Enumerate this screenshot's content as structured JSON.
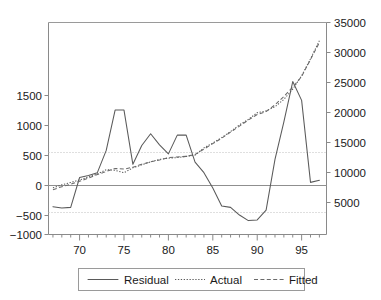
{
  "chart_data": {
    "type": "line",
    "title": "",
    "subtitle": "",
    "xlabel": "",
    "ylabel": "",
    "grid": "horizontal-dotted",
    "legend_position": "bottom",
    "xlim": [
      66.5,
      97.8
    ],
    "x_major_ticks": [
      70,
      75,
      80,
      85,
      90,
      95
    ],
    "x_major_tick_labels": [
      "70",
      "75",
      "80",
      "85",
      "90",
      "95"
    ],
    "x_minor_tick_step": 1,
    "left_axis": {
      "label": "",
      "ylim": [
        -1000,
        2050
      ],
      "ticks": [
        -1000,
        -500,
        0,
        500,
        1000,
        1500
      ],
      "tick_labels": [
        "−1000",
        "−500",
        "0",
        "500",
        "1000",
        "1500"
      ],
      "gridlines": [
        560,
        -540
      ]
    },
    "right_axis": {
      "label": "",
      "ylim": [
        0,
        35000
      ],
      "ticks": [
        5000,
        10000,
        15000,
        20000,
        25000,
        30000,
        35000
      ],
      "tick_labels": [
        "5000",
        "10000",
        "15000",
        "20000",
        "25000",
        "30000",
        "35000"
      ]
    },
    "x": [
      67,
      68,
      69,
      70,
      71,
      72,
      73,
      74,
      75,
      76,
      77,
      78,
      79,
      80,
      81,
      82,
      83,
      84,
      85,
      86,
      87,
      88,
      89,
      90,
      91,
      92,
      93,
      94,
      95,
      96,
      97
    ],
    "series": [
      {
        "name": "Residual",
        "axis": "left",
        "style": "solid",
        "values": [
          -600,
          -620,
          -610,
          -180,
          -150,
          -110,
          210,
          790,
          790,
          10,
          280,
          450,
          290,
          160,
          430,
          430,
          40,
          -110,
          -330,
          -590,
          -610,
          -720,
          -800,
          -790,
          -650,
          80,
          620,
          1200,
          930,
          -250,
          -220
        ]
      },
      {
        "name": "Actual",
        "axis": "right",
        "style": "dotted",
        "values": [
          7700,
          8200,
          8600,
          9000,
          9500,
          10000,
          10700,
          10600,
          10200,
          11000,
          11500,
          12000,
          12400,
          12600,
          12700,
          12900,
          13100,
          14300,
          15100,
          16000,
          17000,
          18100,
          19000,
          20100,
          20400,
          21100,
          22300,
          24000,
          26200,
          29000,
          32000
        ]
      },
      {
        "name": "Fitted",
        "axis": "right",
        "style": "dashed",
        "values": [
          7400,
          7900,
          8300,
          8800,
          9300,
          9900,
          10400,
          10900,
          10800,
          11100,
          11600,
          12000,
          12300,
          12700,
          12800,
          12900,
          13200,
          14100,
          15000,
          15900,
          16900,
          17900,
          18900,
          19800,
          20300,
          21400,
          22800,
          24300,
          26100,
          28900,
          31700
        ]
      }
    ]
  },
  "legend": {
    "items": [
      {
        "label": "Residual",
        "style": "solid"
      },
      {
        "label": "Actual",
        "style": "dotted"
      },
      {
        "label": "Fitted",
        "style": "dashed"
      }
    ]
  },
  "colors": {
    "line": "#5a5a5a",
    "axis": "#8a8a8a",
    "grid": "#b8b8b8",
    "text": "#1a1a1a",
    "background": "#ffffff"
  }
}
